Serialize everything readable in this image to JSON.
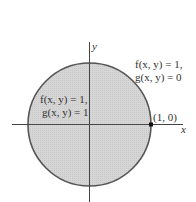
{
  "diagram": {
    "axes": {
      "x_label": "x",
      "y_label": "y"
    },
    "region": {
      "fill": "#d4d4d4",
      "stroke": "#555555",
      "shape": "disk",
      "radius_units": 1
    },
    "point": {
      "label": "(1, 0)"
    },
    "inside_label": {
      "line1": "f(x, y) = 1,",
      "line2": "g(x, y) = 1"
    },
    "outside_label": {
      "line1": "f(x, y) = 1,",
      "line2": "g(x, y) = 0"
    }
  }
}
